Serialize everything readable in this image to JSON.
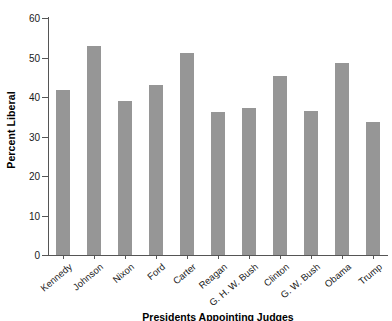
{
  "chart_data": {
    "type": "bar",
    "title": "",
    "xlabel": "Presidents Appointing Judges",
    "ylabel": "Percent Liberal",
    "ylim": [
      0,
      60
    ],
    "yticks": [
      0,
      10,
      20,
      30,
      40,
      50,
      60
    ],
    "ytick_labels": [
      "0",
      "10",
      "20",
      "30",
      "40",
      "50",
      "60"
    ],
    "grid": false,
    "legend": "none",
    "bar_color": "#969696",
    "axis_color": "#555555",
    "categories": [
      "Kennedy",
      "Johnson",
      "Nixon",
      "Ford",
      "Carter",
      "Reagan",
      "G. H. W. Bush",
      "Clinton",
      "G. W. Bush",
      "Obama",
      "Trump"
    ],
    "values": [
      41.9,
      53.0,
      39.0,
      43.0,
      51.2,
      36.2,
      37.3,
      45.3,
      36.5,
      48.6,
      33.6
    ]
  }
}
